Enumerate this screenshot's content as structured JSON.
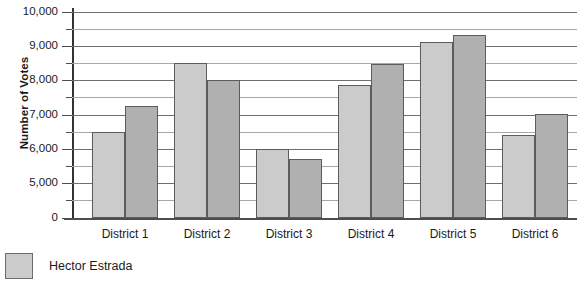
{
  "chart_data": {
    "type": "bar",
    "title": "",
    "xlabel": "",
    "ylabel": "Number of Votes",
    "categories": [
      "District 1",
      "District 2",
      "District 3",
      "District 4",
      "District 5",
      "District 6"
    ],
    "series": [
      {
        "name": "Hector Estrada",
        "color": "#cbcbcb",
        "values": [
          6850,
          8550,
          6050,
          7900,
          9150,
          6450
        ]
      },
      {
        "name": "",
        "color": "#b0b0b0",
        "values": [
          7600,
          8050,
          5750,
          8500,
          9350,
          7050
        ]
      }
    ],
    "ylim": [
      0,
      10000
    ],
    "y_axis_broken": true,
    "y_tick_labels": [
      "10,000",
      "9,000",
      "8,000",
      "7,000",
      "6,000",
      "5,000",
      "0"
    ],
    "y_tick_values": [
      10000,
      9000,
      8000,
      7000,
      6000,
      5000,
      0
    ],
    "y_minor_interval": 500,
    "grid": true,
    "legend_position": "bottom-left"
  },
  "axis": {
    "y_title": "Number of Votes",
    "ticks": [
      {
        "label": "10,000",
        "value": 10000,
        "y": 0,
        "major": true
      },
      {
        "label": "",
        "value": 9500,
        "y": 17,
        "major": false
      },
      {
        "label": "9,000",
        "value": 9000,
        "y": 34,
        "major": true
      },
      {
        "label": "",
        "value": 8500,
        "y": 51,
        "major": false
      },
      {
        "label": "8,000",
        "value": 8000,
        "y": 68,
        "major": true
      },
      {
        "label": "",
        "value": 7500,
        "y": 85,
        "major": false
      },
      {
        "label": "7,000",
        "value": 7000,
        "y": 103,
        "major": true
      },
      {
        "label": "",
        "value": 6500,
        "y": 120,
        "major": false
      },
      {
        "label": "6,000",
        "value": 6000,
        "y": 137,
        "major": true
      },
      {
        "label": "",
        "value": 5500,
        "y": 154,
        "major": false
      },
      {
        "label": "5,000",
        "value": 5000,
        "y": 171,
        "major": true
      },
      {
        "label": "",
        "value": 4500,
        "y": 188,
        "major": false
      },
      {
        "label": "0",
        "value": 0,
        "y": 206,
        "major": true
      }
    ]
  },
  "groups": [
    {
      "label": "District 1",
      "center": 125,
      "bars": [
        {
          "series": "Hector Estrada",
          "value": 6850,
          "x": 92,
          "w": 33,
          "top": 120,
          "color": "#cbcbcb"
        },
        {
          "series": "",
          "value": 7600,
          "x": 125,
          "w": 33,
          "top": 94,
          "color": "#b0b0b0"
        }
      ]
    },
    {
      "label": "District 2",
      "center": 207,
      "bars": [
        {
          "series": "Hector Estrada",
          "value": 8550,
          "x": 174,
          "w": 33,
          "top": 51,
          "color": "#cbcbcb"
        },
        {
          "series": "",
          "value": 8050,
          "x": 207,
          "w": 33,
          "top": 68,
          "color": "#b0b0b0"
        }
      ]
    },
    {
      "label": "District 3",
      "center": 289,
      "bars": [
        {
          "series": "Hector Estrada",
          "value": 6050,
          "x": 256,
          "w": 33,
          "top": 137,
          "color": "#cbcbcb"
        },
        {
          "series": "",
          "value": 5750,
          "x": 289,
          "w": 33,
          "top": 147,
          "color": "#b0b0b0"
        }
      ]
    },
    {
      "label": "District 4",
      "center": 371,
      "bars": [
        {
          "series": "Hector Estrada",
          "value": 7900,
          "x": 338,
          "w": 33,
          "top": 73,
          "color": "#cbcbcb"
        },
        {
          "series": "",
          "value": 8500,
          "x": 371,
          "w": 33,
          "top": 52,
          "color": "#b0b0b0"
        }
      ]
    },
    {
      "label": "District 5",
      "center": 453,
      "bars": [
        {
          "series": "Hector Estrada",
          "value": 9150,
          "x": 420,
          "w": 33,
          "top": 30,
          "color": "#cbcbcb"
        },
        {
          "series": "",
          "value": 9350,
          "x": 453,
          "w": 33,
          "top": 23,
          "color": "#b0b0b0"
        }
      ]
    },
    {
      "label": "District 6",
      "center": 535,
      "bars": [
        {
          "series": "Hector Estrada",
          "value": 6450,
          "x": 502,
          "w": 33,
          "top": 123,
          "color": "#cbcbcb"
        },
        {
          "series": "",
          "value": 7050,
          "x": 535,
          "w": 33,
          "top": 102,
          "color": "#b0b0b0"
        }
      ]
    }
  ],
  "legend": {
    "items": [
      {
        "label": "Hector Estrada",
        "color": "#cbcbcb"
      }
    ]
  }
}
